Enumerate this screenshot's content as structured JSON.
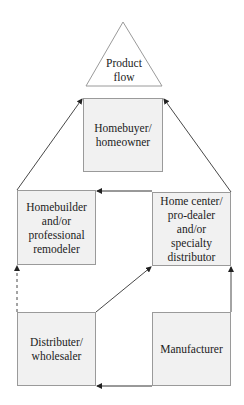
{
  "diagram": {
    "title_shape": {
      "label": "Product\nflow"
    },
    "nodes": {
      "homebuyer": {
        "label": "Homebuyer/\nhomeowner"
      },
      "homebuilder": {
        "label": "Homebuilder\nand/or\nprofessional\nremodeler"
      },
      "home_center": {
        "label": "Home center/\npro-dealer\nand/or\nspecialty\ndistributor"
      },
      "distributer": {
        "label": "Distributer/\nwholesaler"
      },
      "manufacturer": {
        "label": "Manufacturer"
      }
    },
    "edges": [
      {
        "from": "homebuilder",
        "to": "homebuyer",
        "style": "solid"
      },
      {
        "from": "home_center",
        "to": "homebuyer",
        "style": "solid"
      },
      {
        "from": "home_center",
        "to": "homebuilder",
        "style": "solid"
      },
      {
        "from": "distributer",
        "to": "homebuilder",
        "style": "dashed"
      },
      {
        "from": "distributer",
        "to": "home_center",
        "style": "solid"
      },
      {
        "from": "manufacturer",
        "to": "home_center",
        "style": "solid"
      },
      {
        "from": "manufacturer",
        "to": "distributer",
        "style": "solid"
      }
    ],
    "colors": {
      "box_fill": "#f1f1f1",
      "box_border": "#9a9a9a",
      "line": "#333333"
    }
  }
}
